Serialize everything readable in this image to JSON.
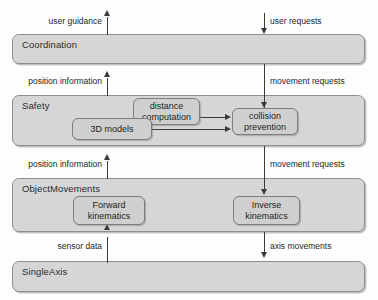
{
  "diagram": {
    "background_color": "#fdfdfd",
    "band_fill": "#d6d6d6",
    "node_fill": "#cfcfcf",
    "line_color": "#3a3a3a",
    "layers": [
      {
        "id": "coordination",
        "label": "Coordination"
      },
      {
        "id": "safety",
        "label": "Safety"
      },
      {
        "id": "objectmovements",
        "label": "ObjectMovements"
      },
      {
        "id": "singleaxis",
        "label": "SingleAxis"
      }
    ],
    "nodes": [
      {
        "id": "three-d-models",
        "label": "3D models"
      },
      {
        "id": "distance-computation",
        "label": "distance\ncomputation",
        "line1": "distance",
        "line2": "computation"
      },
      {
        "id": "collision-prevention",
        "label": "collision\nprevention",
        "line1": "collision",
        "line2": "prevention"
      },
      {
        "id": "forward-kinematics",
        "label": "Forward\nkinematics",
        "line1": "Forward",
        "line2": "kinematics"
      },
      {
        "id": "inverse-kinematics",
        "label": "Inverse\nkinematics",
        "line1": "Inverse",
        "line2": "kinematics"
      }
    ],
    "flows": [
      {
        "id": "user-guidance",
        "label": "user guidance",
        "direction": "up",
        "side": "left"
      },
      {
        "id": "user-requests",
        "label": "user requests",
        "direction": "down",
        "side": "right"
      },
      {
        "id": "position-information-1",
        "label": "position information",
        "direction": "up",
        "side": "left"
      },
      {
        "id": "movement-requests-1",
        "label": "movement requests",
        "direction": "down",
        "side": "right"
      },
      {
        "id": "position-information-2",
        "label": "position information",
        "direction": "up",
        "side": "left"
      },
      {
        "id": "movement-requests-2",
        "label": "movement requests",
        "direction": "down",
        "side": "right"
      },
      {
        "id": "sensor-data",
        "label": "sensor data",
        "direction": "up",
        "side": "left"
      },
      {
        "id": "axis-movements",
        "label": "axis movements",
        "direction": "down",
        "side": "right"
      }
    ]
  }
}
